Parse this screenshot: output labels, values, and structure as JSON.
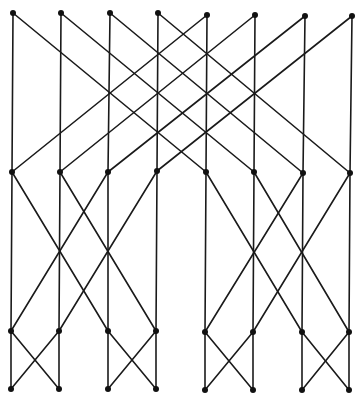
{
  "diagram": {
    "type": "butterfly-network",
    "stroke_color": "#1a1a1a",
    "node_color": "#111111",
    "node_radius": 3,
    "levels": [
      {
        "name": "level-0",
        "y": [
          13,
          13,
          13,
          13,
          15,
          15,
          16,
          16
        ],
        "x": [
          13,
          61,
          110,
          158,
          207,
          255,
          305,
          352
        ]
      },
      {
        "name": "level-1",
        "y": [
          172,
          172,
          172,
          171,
          172,
          172,
          173,
          173
        ],
        "x": [
          12,
          60,
          108,
          157,
          206,
          254,
          303,
          350
        ]
      },
      {
        "name": "level-2",
        "y": [
          331,
          331,
          331,
          331,
          332,
          332,
          332,
          332
        ],
        "x": [
          11,
          59,
          108,
          156,
          205,
          253,
          302,
          349
        ]
      },
      {
        "name": "level-3",
        "y": [
          389,
          389,
          389,
          389,
          390,
          390,
          390,
          390
        ],
        "x": [
          11,
          59,
          108,
          156,
          205,
          253,
          302,
          349
        ]
      }
    ],
    "stage_strides": [
      4,
      2,
      1
    ]
  }
}
